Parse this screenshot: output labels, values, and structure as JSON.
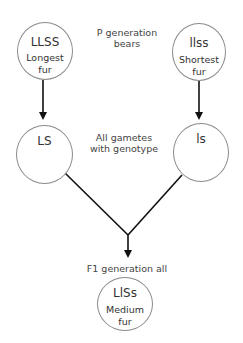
{
  "diagram": {
    "title_labels": {
      "p_generation": [
        "P generation",
        "bears"
      ],
      "gametes": [
        "All gametes",
        "with genotype"
      ],
      "f1_generation": [
        "F1 generation all"
      ]
    },
    "nodes": {
      "parent_left": {
        "genotype": "LLSS",
        "phenotype": [
          "Longest",
          "fur"
        ]
      },
      "parent_right": {
        "genotype": "llss",
        "phenotype": [
          "Shortest",
          "fur"
        ]
      },
      "gamete_left": {
        "genotype": "LS"
      },
      "gamete_right": {
        "genotype": "ls"
      },
      "offspring": {
        "genotype": "LlSs",
        "phenotype": [
          "Medium",
          "fur"
        ]
      }
    },
    "edges": [
      {
        "from": "parent_left",
        "to": "gamete_left",
        "type": "arrow"
      },
      {
        "from": "parent_right",
        "to": "gamete_right",
        "type": "arrow"
      },
      {
        "from": "gamete_left",
        "to": "offspring",
        "type": "merge"
      },
      {
        "from": "gamete_right",
        "to": "offspring",
        "type": "merge"
      }
    ],
    "colors": {
      "circle_stroke": "#8a8a8a",
      "line": "#111111",
      "text": "#333333"
    }
  }
}
